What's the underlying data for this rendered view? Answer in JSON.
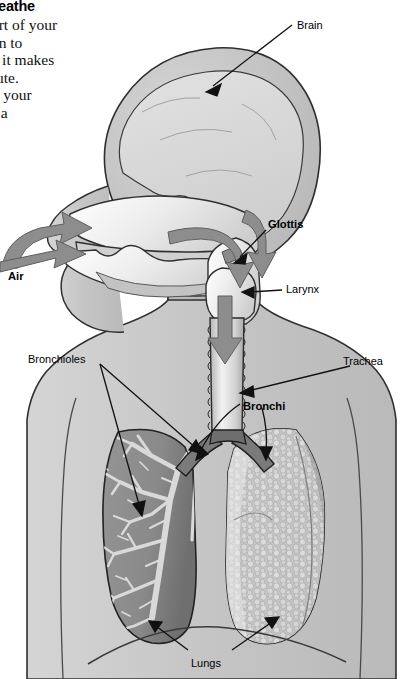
{
  "page": {
    "width": 414,
    "height": 679,
    "background": "#ffffff",
    "kind": "textbook-illustration"
  },
  "article": {
    "heading": "breathe",
    "lines": [
      "part of your",
      "hen to",
      "st, it makes",
      "inute.",
      "ell your",
      "es a"
    ],
    "note": "left column of running text is cropped by the page edge"
  },
  "labels": [
    {
      "id": "brain",
      "text": "Brain",
      "bold": false,
      "x": 297,
      "y": 19
    },
    {
      "id": "glottis",
      "text": "Glottis",
      "bold": true,
      "x": 268,
      "y": 218
    },
    {
      "id": "larynx",
      "text": "Larynx",
      "bold": false,
      "x": 286,
      "y": 283
    },
    {
      "id": "air",
      "text": "Air",
      "bold": true,
      "x": 8,
      "y": 270
    },
    {
      "id": "bronchioles",
      "text": "Bronchioles",
      "bold": false,
      "x": 28,
      "y": 353
    },
    {
      "id": "trachea",
      "text": "Trachea",
      "bold": false,
      "x": 343,
      "y": 355
    },
    {
      "id": "bronchi",
      "text": "Bronchi",
      "bold": true,
      "x": 243,
      "y": 400
    },
    {
      "id": "lungs",
      "text": "Lungs",
      "bold": false,
      "x": 191,
      "y": 657
    }
  ],
  "colors": {
    "page_background": "#ffffff",
    "body_fill": "#c9c9c9",
    "body_outline": "#2b2b2b",
    "brain_fill": "#d8d8d8",
    "airway_light": "#ededed",
    "arrow_fill": "#8f8f8f",
    "lung_left_fill": "#8e8e8e",
    "lung_right_fill": "#b6b6b6",
    "bronchial_tree": "#d6d6d6",
    "leader_line": "#1a1a1a",
    "text": "#000000"
  },
  "anatomy": {
    "structures": [
      "brain",
      "nasal cavity",
      "mouth / oral cavity",
      "tongue",
      "pharynx",
      "glottis",
      "larynx",
      "trachea",
      "bronchi",
      "bronchioles",
      "left lung (bronchial tree cutaway)",
      "right lung (alveolar surface)",
      "diaphragm"
    ],
    "airflow_arrows": [
      {
        "id": "arrow-nose-in",
        "description": "air entering nostril, curving up and back"
      },
      {
        "id": "arrow-mouth-in",
        "description": "air entering mouth, pointing right"
      },
      {
        "id": "arrow-nasal-down",
        "description": "air descending rear nasal cavity"
      },
      {
        "id": "arrow-pharynx",
        "description": "air curving down through pharynx toward glottis"
      },
      {
        "id": "arrow-trachea",
        "description": "air travelling down the trachea"
      }
    ]
  },
  "leader_lines": [
    {
      "from": "brain",
      "to": "cerebrum"
    },
    {
      "from": "glottis",
      "to": "glottis opening"
    },
    {
      "from": "larynx",
      "to": "larynx"
    },
    {
      "from": "trachea",
      "to": "trachea tube"
    },
    {
      "from": "bronchi",
      "to": "left main bronchus"
    },
    {
      "from": "bronchi",
      "to": "right main bronchus"
    },
    {
      "from": "bronchioles",
      "to": "upper bronchiole branch"
    },
    {
      "from": "bronchioles",
      "to": "lower bronchiole branch"
    },
    {
      "from": "lungs",
      "to": "left lung base"
    },
    {
      "from": "lungs",
      "to": "right lung base"
    }
  ]
}
